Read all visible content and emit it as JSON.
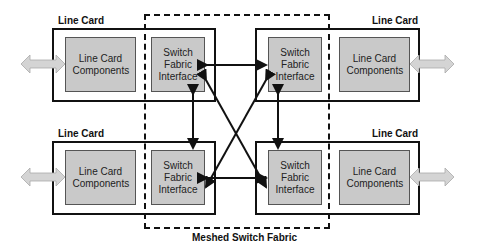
{
  "diagram": {
    "fabric_label": "Meshed Switch Fabric",
    "cards": [
      {
        "position": "top-left",
        "label": "Line Card",
        "components": "Line Card Components",
        "interface": "Switch\nFabric\nInterface"
      },
      {
        "position": "top-right",
        "label": "Line Card",
        "components": "Line Card Components",
        "interface": "Switch\nFabric\nInterface"
      },
      {
        "position": "bottom-left",
        "label": "Line Card",
        "components": "Line Card Components",
        "interface": "Switch\nFabric\nInterface"
      },
      {
        "position": "bottom-right",
        "label": "Line Card",
        "components": "Line Card Components",
        "interface": "Switch\nFabric\nInterface"
      }
    ],
    "connections": [
      {
        "from": "top-left interface",
        "to": "top-right interface",
        "type": "bidirectional"
      },
      {
        "from": "bottom-left interface",
        "to": "bottom-right interface",
        "type": "bidirectional"
      },
      {
        "from": "top-left interface",
        "to": "bottom-left interface",
        "type": "bidirectional"
      },
      {
        "from": "top-right interface",
        "to": "bottom-right interface",
        "type": "bidirectional"
      },
      {
        "from": "top-left interface",
        "to": "bottom-right interface",
        "type": "bidirectional"
      },
      {
        "from": "top-right interface",
        "to": "bottom-left interface",
        "type": "bidirectional"
      }
    ],
    "external_ports": [
      "top-left",
      "top-right",
      "bottom-left",
      "bottom-right"
    ],
    "colors": {
      "inner_fill": "#c9c9c9",
      "port_arrow": "#d4d4d4",
      "line": "#111111"
    }
  }
}
